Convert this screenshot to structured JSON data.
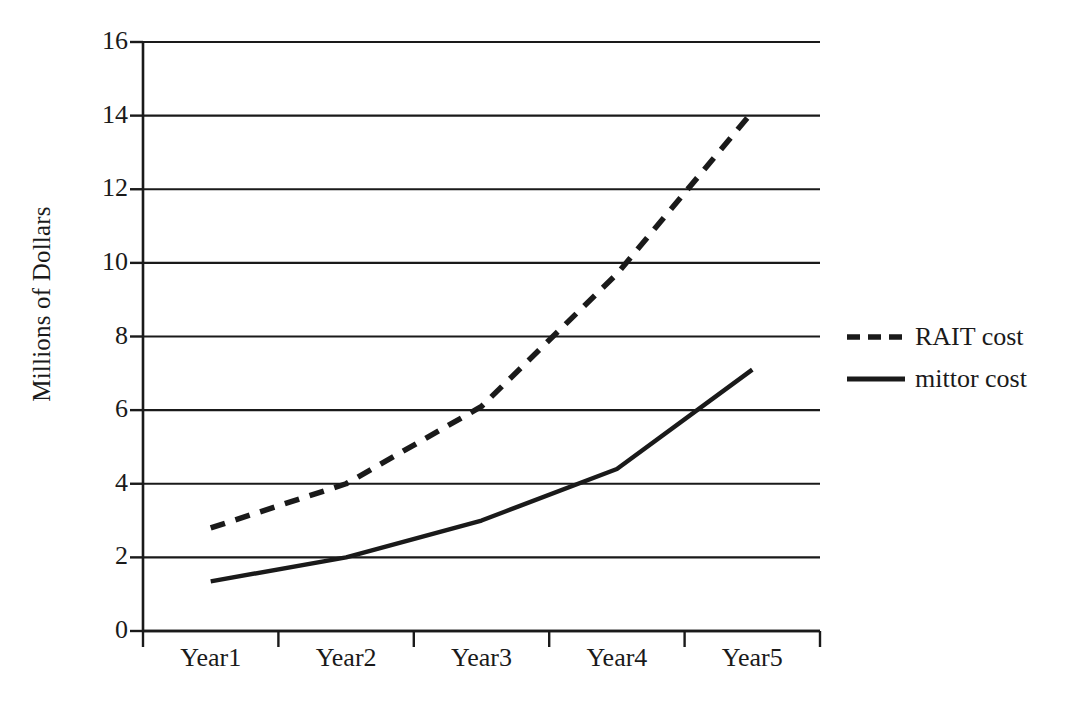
{
  "chart_data": {
    "type": "line",
    "title": "",
    "xlabel": "",
    "ylabel": "Millions of Dollars",
    "categories": [
      "Year1",
      "Year2",
      "Year3",
      "Year4",
      "Year5"
    ],
    "ylim": [
      0,
      16
    ],
    "ytick_labels": [
      "0",
      "2",
      "4",
      "6",
      "8",
      "10",
      "12",
      "14",
      "16"
    ],
    "yticks": [
      0,
      2,
      4,
      6,
      8,
      10,
      12,
      14,
      16
    ],
    "grid": "horizontal",
    "legend_position": "right",
    "series": [
      {
        "name": "RAIT cost",
        "style": "dashed",
        "color": "#1a1a1a",
        "values": [
          2.8,
          4.0,
          6.1,
          9.7,
          14.1
        ]
      },
      {
        "name": "mittor cost",
        "style": "solid",
        "color": "#1a1a1a",
        "values": [
          1.35,
          2.0,
          3.0,
          4.4,
          7.1
        ]
      }
    ]
  },
  "axis": {
    "y_title": "Millions of Dollars"
  },
  "legend": {
    "items": [
      {
        "label": "RAIT cost",
        "style": "dashed"
      },
      {
        "label": "mittor cost",
        "style": "solid"
      }
    ]
  }
}
